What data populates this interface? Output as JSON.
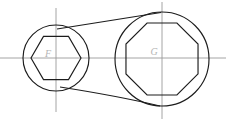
{
  "drawing": {
    "title": "Double-ended box wrench outline drawing",
    "background_color": "#ffffff",
    "line_color": "#1c1c1c",
    "centerline_color": "#9a9a9a",
    "label_color": "#b4b4b4",
    "canvas": {
      "width": 226,
      "height": 121
    }
  },
  "labels": {
    "left_socket": "F",
    "right_socket": "G"
  },
  "left_head": {
    "name": "hexagon-socket-head",
    "center": {
      "x": 56,
      "y": 58
    },
    "circle_radius": 33,
    "socket_shape": "hexagon",
    "socket_sides": 6,
    "socket_radius": 25,
    "socket_orientation_deg": 0,
    "label": "F"
  },
  "right_head": {
    "name": "octagon-socket-head",
    "center": {
      "x": 162,
      "y": 59
    },
    "circle_radius": 47,
    "socket_shape": "octagon",
    "socket_sides": 8,
    "socket_radius": 39,
    "socket_orientation_deg": 22.5,
    "label": "G"
  },
  "arms": {
    "top": {
      "name": "upper-arm-tangent",
      "type": "line",
      "start": {
        "x": 57,
        "y": 29
      },
      "end": {
        "x": 161,
        "y": 12.5
      }
    },
    "bottom": {
      "name": "lower-arm-curve",
      "type": "curve",
      "start": {
        "x": 60,
        "y": 87
      },
      "control": {
        "x": 118,
        "y": 96
      },
      "end": {
        "x": 160,
        "y": 106
      }
    }
  },
  "centerlines": {
    "horizontal": {
      "name": "horizontal-centerline",
      "y": 58,
      "x_start": 0,
      "x_end": 226
    },
    "vertical_left": {
      "name": "vertical-centerline-left",
      "x": 56,
      "y_start": 8,
      "y_end": 112
    },
    "vertical_right": {
      "name": "vertical-centerline-right",
      "x": 162,
      "y_start": 2,
      "y_end": 119
    }
  }
}
